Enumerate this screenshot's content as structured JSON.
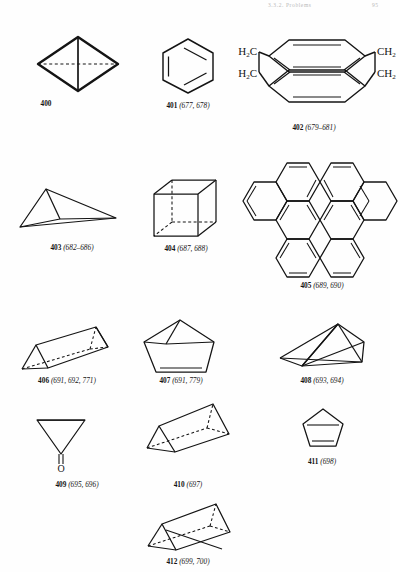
{
  "page": {
    "running_head": "3.3.2. Problems",
    "page_number": "95",
    "background": "#fefefe",
    "ink": "#141414"
  },
  "figures": [
    {
      "id": "fig-400",
      "number": "400",
      "refs": "",
      "caption": "400",
      "shape": "tetrahedron-diamond",
      "name": "tetrahedrane"
    },
    {
      "id": "fig-401",
      "number": "401",
      "refs": "(677, 678)",
      "caption": "401 (677, 678)",
      "shape": "benzene-hexagon",
      "name": "benzene"
    },
    {
      "id": "fig-402",
      "number": "402",
      "refs": "(679–681)",
      "caption": "402 (679–681)",
      "shape": "cyclophane",
      "name": "paracyclophane",
      "atom_labels": [
        "H2C",
        "H2C",
        "CH2",
        "CH2"
      ]
    },
    {
      "id": "fig-403",
      "number": "403",
      "refs": "(682–686)",
      "caption": "403 (682–686)",
      "shape": "flattened-tetrahedron",
      "name": "flattened tetrahedron cage"
    },
    {
      "id": "fig-404",
      "number": "404",
      "refs": "(687, 688)",
      "caption": "404 (687, 688)",
      "shape": "cube",
      "name": "cubane"
    },
    {
      "id": "fig-405",
      "number": "405",
      "refs": "(689, 690)",
      "caption": "405 (689, 690)",
      "shape": "helicene-polycyclic",
      "name": "hexahelicene"
    },
    {
      "id": "fig-406",
      "number": "406",
      "refs": "(691, 692, 771)",
      "caption": "406 (691, 692, 771)",
      "shape": "triangular-prism",
      "name": "prismane"
    },
    {
      "id": "fig-407",
      "number": "407",
      "refs": "(691, 779)",
      "caption": "407 (691, 779)",
      "shape": "housane-pentagon",
      "name": "housane"
    },
    {
      "id": "fig-408",
      "number": "408",
      "refs": "(693, 694)",
      "caption": "408 (693, 694)",
      "shape": "wedge-prism",
      "name": "benzvalene cage"
    },
    {
      "id": "fig-409",
      "number": "409",
      "refs": "(695, 696)",
      "caption": "409 (695, 696)",
      "shape": "funnel-carbonyl",
      "name": "cone ketone",
      "atom_labels": [
        "O"
      ]
    },
    {
      "id": "fig-410",
      "number": "410",
      "refs": "(697)",
      "caption": "410 (697)",
      "shape": "tilted-prism",
      "name": "tilted prism cage"
    },
    {
      "id": "fig-411",
      "number": "411",
      "refs": "(698)",
      "caption": "411 (698)",
      "shape": "cyclopentadiene",
      "name": "cyclopentadiene"
    },
    {
      "id": "fig-412",
      "number": "412",
      "refs": "(699, 700)",
      "caption": "412 (699, 700)",
      "shape": "tilted-prism-double",
      "name": "prism with double bond"
    }
  ]
}
